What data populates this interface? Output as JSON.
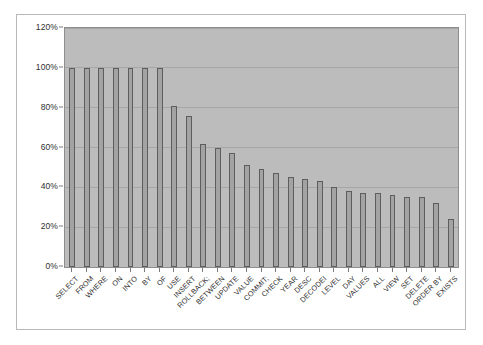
{
  "chart_data": {
    "type": "bar",
    "title": "",
    "subtitle": "",
    "xlabel": "",
    "ylabel": "",
    "ylim": [
      0,
      120
    ],
    "ytick_labels": [
      "0%",
      "20%",
      "40%",
      "60%",
      "80%",
      "100%",
      "120%"
    ],
    "ytick_values": [
      0,
      20,
      40,
      60,
      80,
      100,
      120
    ],
    "grid": true,
    "legend": "none",
    "value_unit": "%",
    "categories": [
      "SELECT",
      "FROM",
      "WHERE",
      "ON",
      "INTO",
      "BY",
      "OF",
      "USE",
      "INSERT",
      "ROLLBACK;",
      "BETWEEN",
      "UPDATE",
      "VALUE",
      "COMMIT;",
      "CHECK",
      "YEAR",
      "DESC",
      "DECODEI",
      "LEVEL",
      "DAY",
      "VALUES",
      "ALL",
      "VIEW",
      "SET",
      "DELETE",
      "ORDER BY",
      "EXISTS"
    ],
    "values": [
      100,
      100,
      100,
      100,
      100,
      100,
      100,
      81,
      76,
      62,
      60,
      57,
      51,
      49,
      47,
      45,
      44,
      43,
      40,
      38,
      37,
      37,
      36,
      35,
      35,
      32,
      24
    ],
    "series": [
      {
        "name": "frequency",
        "values": [
          100,
          100,
          100,
          100,
          100,
          100,
          100,
          81,
          76,
          62,
          60,
          57,
          51,
          49,
          47,
          45,
          44,
          43,
          40,
          38,
          37,
          37,
          36,
          35,
          35,
          32,
          24
        ]
      }
    ]
  },
  "colors": {
    "bar_fill": "#a3a3a3",
    "bar_border": "#5d5d5d",
    "plot_background": "#bcbcbc",
    "gridline": "#a6a6a6",
    "figure_background": "#ffffff",
    "frame_border": "#b9b9b9",
    "text": "#2f2f2f"
  }
}
